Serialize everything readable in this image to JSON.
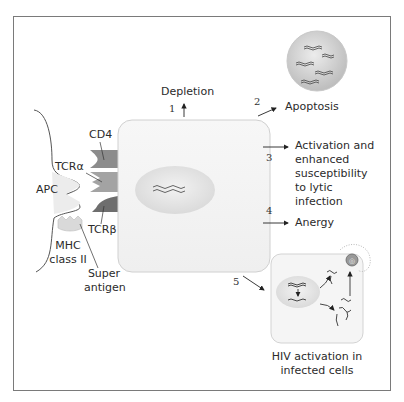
{
  "diagram": {
    "colors": {
      "frame": "#7a7a7a",
      "cell_fill": "#f4f4f4",
      "nucleus_fill": "#e6e6e6",
      "apoptotic_sphere": "#d0d0d0",
      "cd4": "#8c8c8c",
      "tcr_alpha": "#a3a3a3",
      "tcr_beta": "#6e6e6e",
      "mhc": "#d9d9d9",
      "text": "#2b2b2b"
    },
    "receptor_labels": {
      "cd4": "CD4",
      "tcr_alpha": "TCRα",
      "apc": "APC",
      "tcr_beta": "TCRβ",
      "mhc": "MHC",
      "mhc_line2": "class II",
      "superantigen": "Super",
      "superantigen_line2": "antigen"
    },
    "outcomes": [
      {
        "number": "1",
        "label": "Depletion"
      },
      {
        "number": "2",
        "label": "Apoptosis"
      },
      {
        "number": "3",
        "label_lines": [
          "Activation and",
          "enhanced",
          "susceptibility",
          "to lytic",
          "infection"
        ]
      },
      {
        "number": "4",
        "label": "Anergy"
      },
      {
        "number": "5",
        "label_lines": [
          "HIV activation in",
          "infected cells"
        ]
      }
    ]
  }
}
